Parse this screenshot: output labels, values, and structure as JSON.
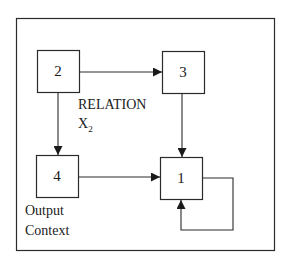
{
  "diagram": {
    "type": "flow",
    "nodes": [
      {
        "id": "2",
        "label": "2"
      },
      {
        "id": "3",
        "label": "3"
      },
      {
        "id": "4",
        "label": "4"
      },
      {
        "id": "1",
        "label": "1"
      }
    ],
    "edges": [
      {
        "from": "2",
        "to": "3"
      },
      {
        "from": "2",
        "to": "4"
      },
      {
        "from": "3",
        "to": "1"
      },
      {
        "from": "4",
        "to": "1"
      },
      {
        "from": "1",
        "to": "1",
        "kind": "self-loop"
      }
    ],
    "annotations": {
      "relation_line1": "RELATION",
      "relation_line2": "X",
      "relation_subscript": "2",
      "output_line1": "Output",
      "output_line2": "Context"
    },
    "colors": {
      "stroke": "#2a2a2a",
      "background": "#ffffff"
    }
  }
}
